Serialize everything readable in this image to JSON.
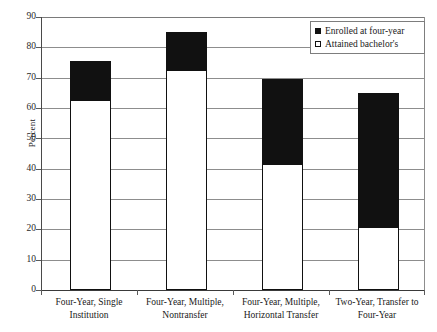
{
  "chart_data": {
    "type": "bar",
    "stacked": true,
    "title": "",
    "xlabel": "",
    "ylabel": "Percent",
    "ylim": [
      0,
      90
    ],
    "ytick_step": 10,
    "yticks": [
      0,
      10,
      20,
      30,
      40,
      50,
      60,
      70,
      80,
      90
    ],
    "grid": true,
    "legend_position": "top-right",
    "categories": [
      "Four-Year, Single Institution",
      "Four-Year, Multiple, Nontransfer",
      "Four-Year, Multiple, Horizontal Transfer",
      "Two-Year, Transfer to Four-Year"
    ],
    "category_lines": [
      [
        "Four-Year, Single",
        "Institution"
      ],
      [
        "Four-Year, Multiple,",
        "Nontransfer"
      ],
      [
        "Four-Year, Multiple,",
        "Horizontal Transfer"
      ],
      [
        "Two-Year, Transfer to",
        "Four-Year"
      ]
    ],
    "series": [
      {
        "name": "Attained bachelor's",
        "color": "#ffffff",
        "values": [
          62.5,
          72.5,
          41.5,
          20.7
        ]
      },
      {
        "name": "Enrolled at four-year",
        "color": "#111111",
        "values": [
          13.0,
          12.5,
          28.0,
          44.3
        ]
      }
    ],
    "totals": [
      75.5,
      85.0,
      69.5,
      65.0
    ]
  },
  "legend": {
    "items": [
      {
        "label": "Enrolled at four-year",
        "swatch": "filled-square"
      },
      {
        "label": "Attained bachelor's",
        "swatch": "open-square"
      }
    ]
  },
  "axes": {
    "y_title": "Percent",
    "y_tick_labels": [
      "90",
      "80",
      "70",
      "60",
      "50",
      "40",
      "30",
      "20",
      "10",
      "0"
    ]
  }
}
